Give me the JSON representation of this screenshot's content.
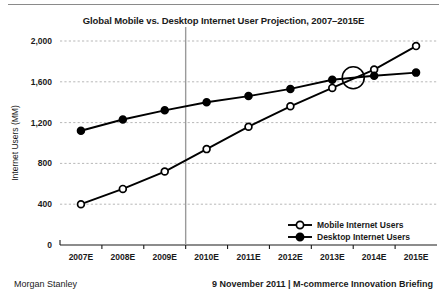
{
  "footer": {
    "source": "Morgan Stanley",
    "briefing": "9 November 2011 | M-commerce Innovation Briefing"
  },
  "chart_data": {
    "type": "line",
    "title": "Global Mobile vs. Desktop Internet User Projection, 2007–2015E",
    "xlabel": "",
    "ylabel": "Internet Users (MM)",
    "categories": [
      "2007E",
      "2008E",
      "2009E",
      "2010E",
      "2011E",
      "2012E",
      "2013E",
      "2014E",
      "2015E"
    ],
    "ylim": [
      0,
      2000
    ],
    "yticks": [
      0,
      400,
      800,
      1200,
      1600,
      2000
    ],
    "ytick_labels": [
      "0",
      "400",
      "800",
      "1,200",
      "1,600",
      "2,000"
    ],
    "grid": true,
    "legend_position": "bottom-right",
    "series": [
      {
        "name": "Mobile Internet Users",
        "marker": "open-circle",
        "values": [
          400,
          550,
          720,
          940,
          1160,
          1360,
          1540,
          1720,
          1950
        ]
      },
      {
        "name": "Desktop Internet Users",
        "marker": "filled-circle",
        "values": [
          1120,
          1230,
          1320,
          1400,
          1460,
          1530,
          1620,
          1660,
          1690
        ]
      }
    ],
    "annotations": [
      {
        "type": "circle-highlight",
        "label": "crossover-highlight",
        "x_between": [
          "2013E",
          "2014E"
        ],
        "y_approx": 1640
      },
      {
        "type": "vertical-line",
        "label": "present-day-divider",
        "x_between": [
          "2009E",
          "2010E"
        ]
      }
    ]
  }
}
